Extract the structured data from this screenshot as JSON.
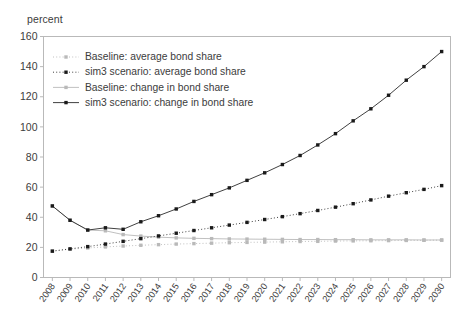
{
  "axis_unit_label": "percent",
  "legend": {
    "items": [
      {
        "label": "Baseline: average bond share",
        "marker": "dotted-light-marker",
        "color": "#b9b9b9",
        "dash": "1,2.2",
        "point_fill": "#b9b9b9"
      },
      {
        "label": "sim3 scenario: average bond share",
        "marker": "dotted-dark-marker",
        "color": "#2a2a2a",
        "dash": "1,2.2",
        "point_fill": "#1a1a1a"
      },
      {
        "label": "Baseline: change in bond share",
        "marker": "solid-light-marker",
        "color": "#b9b9b9",
        "dash": "none",
        "point_fill": "#b9b9b9"
      },
      {
        "label": "sim3 scenario: change in bond share",
        "marker": "solid-dark-marker",
        "color": "#2a2a2a",
        "dash": "none",
        "point_fill": "#1a1a1a"
      }
    ]
  },
  "chart_data": {
    "type": "line",
    "title": "",
    "xlabel": "",
    "ylabel": "percent",
    "ylim": [
      0,
      160
    ],
    "ytick_step": 20,
    "yticks": [
      0,
      20,
      40,
      60,
      80,
      100,
      120,
      140,
      160
    ],
    "grid": false,
    "legend_position": "upper-left-inside",
    "x": [
      2008,
      2009,
      2010,
      2011,
      2012,
      2013,
      2014,
      2015,
      2016,
      2017,
      2018,
      2019,
      2020,
      2021,
      2022,
      2023,
      2024,
      2025,
      2026,
      2027,
      2028,
      2029,
      2030
    ],
    "categories": [
      "2008",
      "2009",
      "2010",
      "2011",
      "2012",
      "2013",
      "2014",
      "2015",
      "2016",
      "2017",
      "2018",
      "2019",
      "2020",
      "2021",
      "2022",
      "2023",
      "2024",
      "2025",
      "2026",
      "2027",
      "2028",
      "2029",
      "2030"
    ],
    "series": [
      {
        "name": "Baseline: average bond share",
        "values": [
          17.5,
          18.8,
          19.6,
          20.3,
          20.9,
          21.4,
          21.8,
          22.2,
          22.5,
          22.8,
          23.1,
          23.3,
          23.5,
          23.7,
          23.9,
          24.0,
          24.2,
          24.3,
          24.4,
          24.5,
          24.6,
          24.7,
          24.8
        ]
      },
      {
        "name": "sim3 scenario: average bond share",
        "values": [
          17.5,
          19.0,
          20.5,
          22.2,
          24.0,
          25.8,
          27.6,
          29.4,
          31.2,
          33.0,
          34.8,
          36.6,
          38.5,
          40.4,
          42.4,
          44.5,
          46.7,
          49.0,
          51.5,
          54.0,
          56.3,
          58.5,
          61.0
        ]
      },
      {
        "name": "Baseline: change in bond share",
        "values": [
          47.5,
          38.0,
          31.5,
          31.0,
          28.5,
          27.5,
          26.8,
          26.3,
          26.0,
          25.8,
          25.6,
          25.5,
          25.4,
          25.3,
          25.2,
          25.2,
          25.1,
          25.1,
          25.0,
          25.0,
          25.0,
          24.9,
          24.9
        ]
      },
      {
        "name": "sim3 scenario: change in bond share",
        "values": [
          47.5,
          38.0,
          31.5,
          33.0,
          32.0,
          37.0,
          41.0,
          45.5,
          50.5,
          55.0,
          59.5,
          64.5,
          69.5,
          75.0,
          81.0,
          88.0,
          95.5,
          104.0,
          112.0,
          121.0,
          131.0,
          140.0,
          150.0
        ]
      }
    ]
  }
}
